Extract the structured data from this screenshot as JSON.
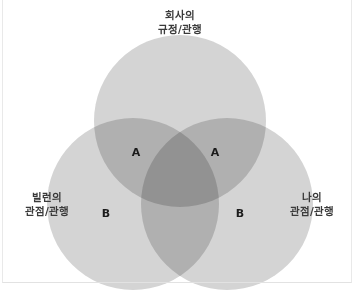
{
  "figure": {
    "type": "venn-diagram-3-set",
    "background_color": "#ffffff",
    "frame_color": "#e9e9e9"
  },
  "colors": {
    "circle_fill": "#d4d4d4",
    "two_way_overlap": "#bcbcbc",
    "three_way_overlap": "#a7a7a7",
    "label_text": "#1c1c1c",
    "set_label_text": "#3a3a3a"
  },
  "sets": [
    {
      "id": "company",
      "position": "top",
      "label_lines": [
        "회사의",
        "규정/관행"
      ],
      "cx": 180,
      "cy": 121,
      "r": 86
    },
    {
      "id": "villain",
      "position": "bottom-left",
      "label_lines": [
        "빌런의",
        "관점/관행"
      ],
      "cx": 133,
      "cy": 204,
      "r": 86
    },
    {
      "id": "mine",
      "position": "bottom-right",
      "label_lines": [
        "나의",
        "관점/관행"
      ],
      "cx": 227,
      "cy": 204,
      "r": 86
    }
  ],
  "region_labels": [
    {
      "id": "a-left",
      "text": "A",
      "x": 136,
      "y": 152
    },
    {
      "id": "a-right",
      "text": "A",
      "x": 215,
      "y": 152
    },
    {
      "id": "b-left",
      "text": "B",
      "x": 106,
      "y": 213
    },
    {
      "id": "b-right",
      "text": "B",
      "x": 240,
      "y": 213
    }
  ],
  "set_label_positions": [
    {
      "id": "company",
      "x": 180,
      "y": 8
    },
    {
      "id": "villain",
      "x": 47,
      "y": 190
    },
    {
      "id": "mine",
      "x": 312,
      "y": 190
    }
  ]
}
